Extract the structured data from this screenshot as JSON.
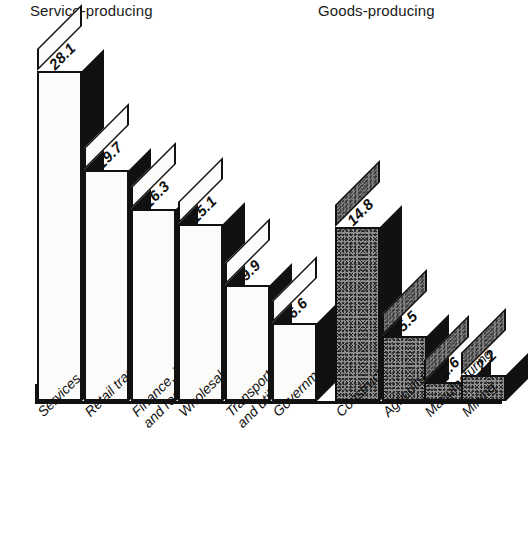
{
  "headers": {
    "service": "Service-producing",
    "goods": "Goods-producing"
  },
  "chart_data": {
    "type": "bar",
    "title": "",
    "subtitle": "",
    "xlabel": "",
    "ylabel": "",
    "grid": false,
    "legend_position": "none",
    "style": "3d-isometric-bars",
    "ylim": [
      0,
      28.1
    ],
    "categories": [
      "Services",
      "Retail trade",
      "Finance, insurance and real estate",
      "Wholesale trade",
      "Transportation and utilities",
      "Government",
      "Construction",
      "Agriculture",
      "Manufacturing",
      "Mining"
    ],
    "values": [
      28.1,
      19.7,
      16.3,
      15.1,
      9.9,
      6.6,
      14.8,
      5.5,
      1.6,
      2.2
    ],
    "groups": [
      {
        "name": "Service-producing",
        "fill": "white",
        "categories": [
          "Services",
          "Retail trade",
          "Finance, insurance and real estate",
          "Wholesale trade",
          "Transportation and utilities",
          "Government"
        ],
        "values": [
          28.1,
          19.7,
          16.3,
          15.1,
          9.9,
          6.6
        ]
      },
      {
        "name": "Goods-producing",
        "fill": "gray-stipple",
        "categories": [
          "Construction",
          "Agriculture",
          "Manufacturing",
          "Mining"
        ],
        "values": [
          14.8,
          5.5,
          1.6,
          2.2
        ]
      }
    ]
  },
  "bars": [
    {
      "id": "services",
      "label_line1": "Services",
      "label_line2": "",
      "value": "28.1",
      "group": "service"
    },
    {
      "id": "retail-trade",
      "label_line1": "Retail trade",
      "label_line2": "",
      "value": "19.7",
      "group": "service"
    },
    {
      "id": "finance-insurance-real-estate",
      "label_line1": "Finance, insurance",
      "label_line2": "and real estate",
      "value": "16.3",
      "group": "service"
    },
    {
      "id": "wholesale-trade",
      "label_line1": "Wholesale trade",
      "label_line2": "",
      "value": "15.1",
      "group": "service"
    },
    {
      "id": "transportation-utilities",
      "label_line1": "Transportation",
      "label_line2": "and utilities",
      "value": "9.9",
      "group": "service"
    },
    {
      "id": "government",
      "label_line1": "Government",
      "label_line2": "",
      "value": "6.6",
      "group": "service"
    },
    {
      "id": "construction",
      "label_line1": "Construction",
      "label_line2": "",
      "value": "14.8",
      "group": "goods"
    },
    {
      "id": "agriculture",
      "label_line1": "Agriculture",
      "label_line2": "",
      "value": "5.5",
      "group": "goods"
    },
    {
      "id": "manufacturing",
      "label_line1": "Manufacturing",
      "label_line2": "",
      "value": "1.6",
      "group": "goods"
    },
    {
      "id": "mining",
      "label_line1": "Mining",
      "label_line2": "",
      "value": "2.2",
      "group": "goods"
    }
  ]
}
